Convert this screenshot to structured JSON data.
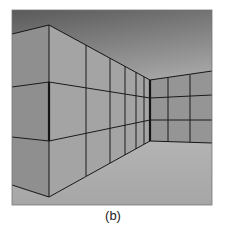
{
  "figure": {
    "caption": "(b)",
    "colors": {
      "ceiling_top": "#5f5f5f",
      "ceiling_bottom": "#e6e6e6",
      "left_wall": "#8e8e8e",
      "receding_wall": "#a3a3a3",
      "back_wall": "#939393",
      "floor": "#ababab",
      "grid_line": "#1a1a1a"
    }
  }
}
